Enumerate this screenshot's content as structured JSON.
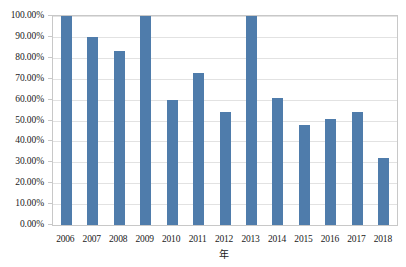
{
  "chart_data": {
    "type": "bar",
    "title": "",
    "subtitle": "",
    "xlabel": "年",
    "ylabel": "",
    "categories": [
      "2006",
      "2007",
      "2008",
      "2009",
      "2010",
      "2011",
      "2012",
      "2013",
      "2014",
      "2015",
      "2016",
      "2017",
      "2018"
    ],
    "values": [
      100.0,
      90.0,
      83.5,
      100.0,
      59.8,
      72.5,
      54.0,
      100.0,
      61.0,
      48.0,
      50.5,
      54.0,
      32.0
    ],
    "series": [
      {
        "name": "",
        "values": [
          100.0,
          90.0,
          83.5,
          100.0,
          59.8,
          72.5,
          54.0,
          100.0,
          61.0,
          48.0,
          50.5,
          54.0,
          32.0
        ]
      }
    ],
    "ylim": [
      0,
      100
    ],
    "ytick_values": [
      0,
      10,
      20,
      30,
      40,
      50,
      60,
      70,
      80,
      90,
      100
    ],
    "ytick_labels": [
      "0.00%",
      "10.00%",
      "20.00%",
      "30.00%",
      "40.00%",
      "50.00%",
      "60.00%",
      "70.00%",
      "80.00%",
      "90.00%",
      "100.00%"
    ],
    "xtick_labels": [
      "2006",
      "2007",
      "2008",
      "2009",
      "2010",
      "2011",
      "2012",
      "2013",
      "2014",
      "2015",
      "2016",
      "2017",
      "2018"
    ],
    "grid": true,
    "grid_axis": "y",
    "legend": false,
    "legend_position": "none",
    "annotations": [],
    "bar_color": "#4f7cab",
    "grid_color": "#e2e2e2",
    "axis_border_color": "#c8c8c8",
    "background_color": "#ffffff",
    "text_color": "#1a1a1a"
  }
}
